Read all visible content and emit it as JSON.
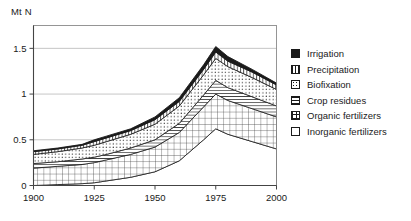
{
  "chart_data": {
    "type": "area",
    "title": "",
    "subtitle": "",
    "xlabel": "",
    "ylabel": "Mt N",
    "ylabel_position": "top-left",
    "stacked": true,
    "grid": "horizontal",
    "legend_position": "right",
    "x": [
      1900,
      1910,
      1920,
      1925,
      1930,
      1940,
      1950,
      1960,
      1970,
      1975,
      1980,
      1990,
      2000
    ],
    "xlim": [
      1900,
      2000
    ],
    "ylim": [
      0,
      1.75
    ],
    "xticks": [
      "1900",
      "1925",
      "1950",
      "1975",
      "2000"
    ],
    "yticks": [
      "0",
      "0.5",
      "1",
      "1.5"
    ],
    "ytick_values": [
      0,
      0.5,
      1,
      1.5
    ],
    "units": "Mt N",
    "series": [
      {
        "name": "Inorganic fertilizers",
        "pattern": "empty",
        "order": 1,
        "values": [
          0.0,
          0.01,
          0.02,
          0.03,
          0.05,
          0.09,
          0.15,
          0.27,
          0.5,
          0.62,
          0.56,
          0.48,
          0.4
        ]
      },
      {
        "name": "Organic fertilizers",
        "pattern": "grid",
        "order": 2,
        "values": [
          0.19,
          0.2,
          0.21,
          0.22,
          0.23,
          0.25,
          0.27,
          0.31,
          0.36,
          0.38,
          0.37,
          0.36,
          0.35
        ]
      },
      {
        "name": "Crop residues",
        "pattern": "horizontal-hatch",
        "order": 3,
        "values": [
          0.05,
          0.05,
          0.06,
          0.06,
          0.06,
          0.07,
          0.08,
          0.1,
          0.13,
          0.15,
          0.14,
          0.13,
          0.12
        ]
      },
      {
        "name": "Biofixation",
        "pattern": "dots",
        "order": 4,
        "values": [
          0.1,
          0.11,
          0.12,
          0.13,
          0.14,
          0.15,
          0.17,
          0.19,
          0.22,
          0.24,
          0.23,
          0.21,
          0.18
        ]
      },
      {
        "name": "Precipitation",
        "pattern": "vertical-hatch",
        "order": 5,
        "values": [
          0.03,
          0.03,
          0.03,
          0.04,
          0.04,
          0.04,
          0.05,
          0.05,
          0.06,
          0.07,
          0.06,
          0.06,
          0.05
        ]
      },
      {
        "name": "Irrigation",
        "pattern": "solid-black",
        "order": 6,
        "values": [
          0.01,
          0.01,
          0.01,
          0.02,
          0.02,
          0.02,
          0.03,
          0.04,
          0.05,
          0.06,
          0.05,
          0.03,
          0.02
        ]
      }
    ],
    "totals": [
      0.38,
      0.41,
      0.45,
      0.5,
      0.54,
      0.62,
      0.75,
      0.96,
      1.32,
      1.52,
      1.41,
      1.27,
      1.12
    ],
    "annotations": []
  },
  "legend": {
    "items": [
      {
        "label": "Irrigation",
        "swatch": "solid-black-swatch"
      },
      {
        "label": "Precipitation",
        "swatch": "vertical-hatch-swatch"
      },
      {
        "label": "Biofixation",
        "swatch": "dots-swatch"
      },
      {
        "label": "Crop residues",
        "swatch": "horizontal-hatch-swatch"
      },
      {
        "label": "Organic fertilizers",
        "swatch": "grid-swatch"
      },
      {
        "label": "Inorganic fertilizers",
        "swatch": "empty-swatch"
      }
    ]
  },
  "colors": {
    "ink": "#1a1a1a",
    "gridline": "#b8b8b8",
    "axis": "#555555",
    "background": "#ffffff"
  }
}
